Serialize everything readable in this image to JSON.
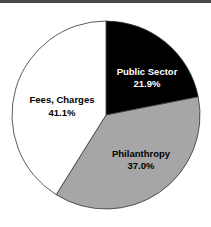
{
  "chart_data": {
    "type": "pie",
    "title": "",
    "categories": [
      "Public Sector",
      "Philanthropy",
      "Fees, Charges"
    ],
    "values": [
      21.9,
      37.0,
      41.1
    ],
    "value_labels": [
      "21.9%",
      "37.0%",
      "41.1%"
    ],
    "colors": [
      "#000000",
      "#a6a6a6",
      "#ffffff"
    ],
    "start_angle": "12 o'clock, clockwise",
    "legend": "none (labels inside slices)"
  },
  "slices": [
    {
      "name": "Public Sector",
      "pct": "21.9%",
      "color": "#000000",
      "text_color": "#ffffff"
    },
    {
      "name": "Philanthropy",
      "pct": "37.0%",
      "color": "#a6a6a6",
      "text_color": "#000000"
    },
    {
      "name": "Fees, Charges",
      "pct": "41.1%",
      "color": "#ffffff",
      "text_color": "#000000"
    }
  ]
}
